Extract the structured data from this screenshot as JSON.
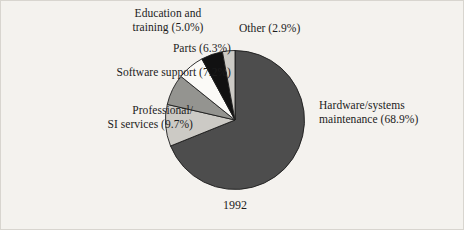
{
  "figure": {
    "caption": "1992",
    "background_color": "#f4f2ee"
  },
  "labels": {
    "education": "Education and\ntraining (5.0%)",
    "other": "Other (2.9%)",
    "parts": "Parts (6.3%)",
    "software": "Software support (7.2%)",
    "professional": "Professional/\nSI services (9.7%)",
    "hardware": "Hardware/systems\nmaintenance (68.9%)"
  },
  "chart_data": {
    "type": "pie",
    "title": "",
    "subtitle": "",
    "xlabel": "",
    "ylabel": "",
    "caption": "1992",
    "units": "percent",
    "total": 100.0,
    "start_angle_deg": 0,
    "direction": "clockwise",
    "legend": "none (direct labels with leader-free placement)",
    "grid": false,
    "categories": [
      "Hardware/systems maintenance",
      "Professional/SI services",
      "Software support",
      "Parts",
      "Education and training",
      "Other"
    ],
    "values": [
      68.9,
      9.7,
      7.2,
      6.3,
      5.0,
      2.9
    ],
    "slices": [
      {
        "label": "Hardware/systems maintenance",
        "value": 68.9,
        "display": "Hardware/systems maintenance (68.9%)",
        "color": "#4d4d4d",
        "start_deg": 0.0,
        "end_deg": 248.04
      },
      {
        "label": "Professional/SI services",
        "value": 9.7,
        "display": "Professional/ SI services (9.7%)",
        "color": "#cccac5",
        "start_deg": 248.04,
        "end_deg": 282.96
      },
      {
        "label": "Software support",
        "value": 7.2,
        "display": "Software support (7.2%)",
        "color": "#949490",
        "start_deg": 282.96,
        "end_deg": 308.88
      },
      {
        "label": "Parts",
        "value": 6.3,
        "display": "Parts (6.3%)",
        "color": "#fbfaf7",
        "start_deg": 308.88,
        "end_deg": 331.56
      },
      {
        "label": "Education and training",
        "value": 5.0,
        "display": "Education and training (5.0%)",
        "color": "#111111",
        "start_deg": 331.56,
        "end_deg": 349.56
      },
      {
        "label": "Other",
        "value": 2.9,
        "display": "Other (2.9%)",
        "color": "#cccac5",
        "start_deg": 349.56,
        "end_deg": 360.0
      }
    ]
  }
}
